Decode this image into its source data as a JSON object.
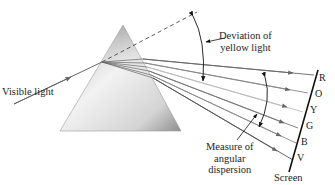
{
  "labels": {
    "incident": "Visible light",
    "deviation_line1": "Deviation of",
    "deviation_line2": "yellow light",
    "dispersion_line1": "Measure of",
    "dispersion_line2": "angular",
    "dispersion_line3": "dispersion",
    "screen": "Screen"
  },
  "spectrum": [
    {
      "letter": "R",
      "name": "red"
    },
    {
      "letter": "O",
      "name": "orange"
    },
    {
      "letter": "Y",
      "name": "yellow"
    },
    {
      "letter": "G",
      "name": "green"
    },
    {
      "letter": "B",
      "name": "blue"
    },
    {
      "letter": "V",
      "name": "violet"
    }
  ],
  "colors": {
    "prism_light": "#f4f4f4",
    "prism_dark": "#9a9a9a",
    "ray": "#555555",
    "ray_light": "#aaaaaa",
    "screen": "#111111"
  }
}
